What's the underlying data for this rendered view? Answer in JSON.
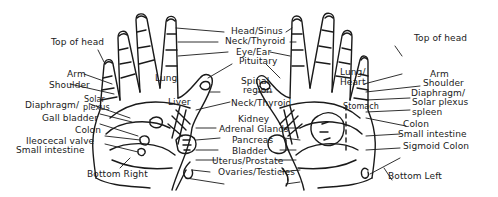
{
  "diagram": {
    "type": "hand reflexology chart",
    "line_color": "#1a1a1a",
    "background": "#ffffff",
    "left_hand": {
      "caption": "Bottom Right",
      "labels": {
        "top_of_head": "Top of head",
        "arm": "Arm",
        "shoulder": "Shoulder",
        "diaphragm": "Diaphragm/",
        "solar": "Solar",
        "plexus": "plexus",
        "gall_bladder": "Gall bladder",
        "colon": "Colon",
        "ileocecal_valve": "Ileocecal valve",
        "small_intestine": "Small intestine",
        "lung": "Lung",
        "liver": "Liver"
      }
    },
    "center": {
      "labels": {
        "head_sinus": "Head/Sinus",
        "neck_thyroid_top": "Neck/Thyroid",
        "eye_ear": "Eye/Ear",
        "pituitary": "Pituitary",
        "spinal": "Spinal",
        "region": "region",
        "neck_thyroid": "Neck/Thyroid",
        "kidney": "Kidney",
        "adrenal_glands": "Adrenal Glands",
        "pancreas": "Pancreas",
        "bladder": "Bladder",
        "uterus_prostate": "Uterus/Prostate",
        "ovaries_testicles": "Ovaries/Testicles"
      }
    },
    "right_hand": {
      "caption": "Bottom Left",
      "labels": {
        "top_of_head": "Top of head",
        "arm": "Arm",
        "shoulder": "Shoulder",
        "diaphragm": "Diaphragm/",
        "solar_plexus": "Solar plexus",
        "spleen": "spleen",
        "colon": "Colon",
        "small_intestine": "Small intestine",
        "sigmoid_colon": "Sigmoid Colon",
        "lung": "Lung/",
        "heart": "Heart",
        "stomach": "Stomach"
      }
    }
  }
}
